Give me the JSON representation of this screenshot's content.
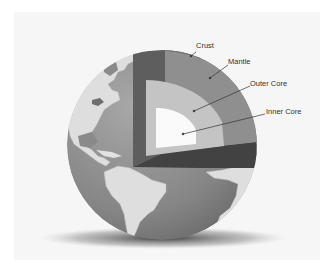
{
  "diagram": {
    "labels": [
      {
        "id": "crust",
        "text": "Crust"
      },
      {
        "id": "mantle",
        "text": "Mantle"
      },
      {
        "id": "outer_core",
        "text": "Outer Core"
      },
      {
        "id": "inner_core",
        "text": "Inner Core"
      }
    ],
    "colors": {
      "background": "#f6f6f6",
      "ocean": "#8a8a8a",
      "land": "#dcdcdc",
      "crust": "#6e6e6e",
      "mantle_face": "#8f8f8f",
      "mantle_side": "#5a5a5a",
      "mantle_bottom": "#3f3f3f",
      "outer_core": "#c4c4c4",
      "inner_core": "#fafafa",
      "shadow": "#555555"
    }
  }
}
